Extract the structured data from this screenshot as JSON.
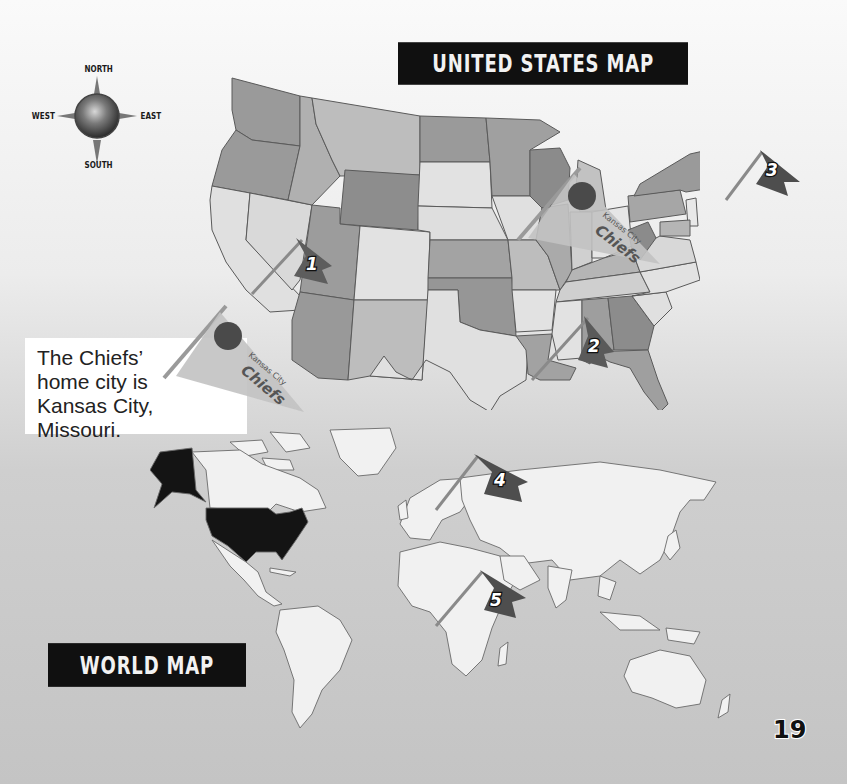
{
  "us_map": {
    "title": "United States Map",
    "state_fill_shades": [
      "#8e8e8e",
      "#a8a8a8",
      "#bdbdbd",
      "#d6d6d6",
      "#e4e4e4"
    ],
    "outline_color": "#555555"
  },
  "world_map": {
    "title": "World Map",
    "highlighted_country": "United States",
    "highlight_color": "#141414",
    "land_color": "#f1f1f1",
    "ocean_color": "#c6c6c6"
  },
  "compass": {
    "north": "NORTH",
    "south": "SOUTH",
    "east": "EAST",
    "west": "WEST"
  },
  "callout": {
    "line1": "The Chiefs’",
    "line2": "home city is",
    "line3": "Kansas City, Missouri."
  },
  "pennants": [
    {
      "team_top": "Kansas City",
      "team_main": "Chiefs",
      "location": "callout"
    },
    {
      "team_top": "Kansas City",
      "team_main": "Chiefs",
      "location": "Kansas City, Missouri"
    }
  ],
  "flags": [
    {
      "number": "1",
      "location": "Southern California"
    },
    {
      "number": "2",
      "location": "Louisiana"
    },
    {
      "number": "3",
      "location": "New Jersey"
    },
    {
      "number": "4",
      "location": "Scandinavia / Northern Europe"
    },
    {
      "number": "5",
      "location": "Central Africa"
    }
  ],
  "page": {
    "number": "19"
  }
}
